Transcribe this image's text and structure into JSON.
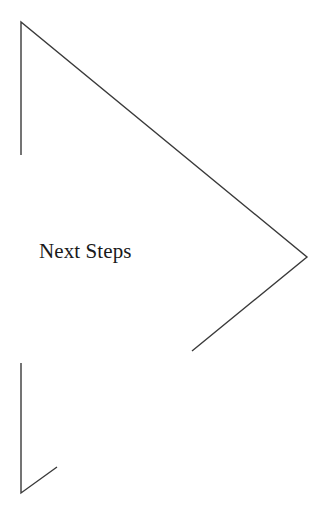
{
  "slide": {
    "title": "Next Steps",
    "background_color": "#ffffff",
    "width": 329,
    "height": 523
  },
  "label": {
    "text": "Next Steps",
    "color": "#1a1a1a",
    "font_size_px": 21,
    "x": 39,
    "y": 238
  },
  "graphics": {
    "stroke_color": "#3a3a3a",
    "stroke_width_px": 1.4,
    "shapes": [
      {
        "name": "large-chevron-arrow",
        "description": "Large open chevron: vertical stem at left, long diagonal down-right to a point, short diagonal back down-left",
        "points": "21,155 21,22 307,257 192,351"
      },
      {
        "name": "small-corner-arrow",
        "description": "Small open arrow: vertical stem descending, then short diagonal up-right",
        "points": "21,363 21,493 57,467"
      }
    ]
  }
}
